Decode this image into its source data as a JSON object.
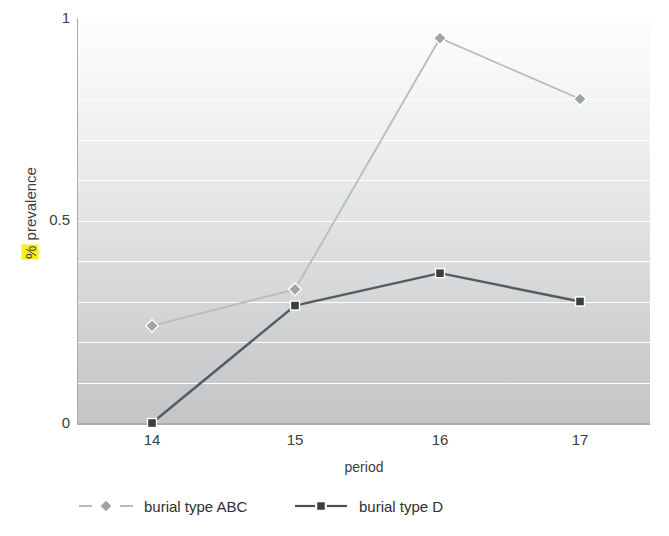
{
  "chart_data": {
    "type": "line",
    "title": "",
    "xlabel": "period",
    "ylabel": "% prevalence",
    "ylabel_highlight": "%",
    "ylabel_rest": " prevalence",
    "categories": [
      "14",
      "15",
      "16",
      "17"
    ],
    "x": [
      14,
      15,
      16,
      17
    ],
    "series": [
      {
        "name": "burial type ABC",
        "values": [
          0.24,
          0.33,
          0.95,
          0.8
        ],
        "color": "#b9bcbf",
        "marker": "diamond",
        "linestyle": "solid"
      },
      {
        "name": "burial type D",
        "values": [
          0.0,
          0.29,
          0.37,
          0.3
        ],
        "color": "#575b5e",
        "marker": "square",
        "linestyle": "solid"
      }
    ],
    "ylim": [
      0,
      1
    ],
    "yticks": [
      0,
      0.5,
      1
    ],
    "ytick_labels": [
      "0",
      "0.5",
      "1"
    ],
    "gridlines_y": [
      0.1,
      0.2,
      0.3,
      0.4,
      0.5,
      0.6,
      0.7,
      0.8,
      0.9
    ],
    "grid": true,
    "legend_position": "bottom",
    "plot_background": "vertical gradient white to gray",
    "highlight_color": "#f5f019"
  },
  "axis": {
    "y_labels": [
      "1",
      "0.5",
      "0"
    ],
    "x_labels": [
      "14",
      "15",
      "16",
      "17"
    ],
    "x_title": "period",
    "y_title_part1": "%",
    "y_title_part2": " prevalence"
  },
  "legend": {
    "items": [
      {
        "label": "burial type ABC",
        "color": "#b9bcbf",
        "marker": "diamond"
      },
      {
        "label": "burial type D",
        "color": "#575b5e",
        "marker": "square"
      }
    ]
  }
}
